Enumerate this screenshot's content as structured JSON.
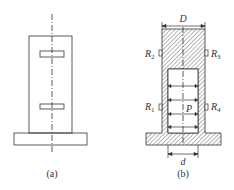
{
  "figures": [
    {
      "id": "a",
      "caption": "(a)",
      "description": "column with two strain gauges, external view"
    },
    {
      "id": "b",
      "caption": "(b)",
      "description": "sectional view of hollow column under internal pressure",
      "dimensions": {
        "outer_diameter": "D",
        "inner_diameter": "d"
      },
      "pressure_label": "P",
      "gauges": [
        {
          "name": "R",
          "sub": "2",
          "side": "left",
          "position": "upper"
        },
        {
          "name": "R",
          "sub": "3",
          "side": "right",
          "position": "upper"
        },
        {
          "name": "R",
          "sub": "1",
          "side": "left",
          "position": "lower"
        },
        {
          "name": "R",
          "sub": "4",
          "side": "right",
          "position": "lower"
        }
      ]
    }
  ],
  "colors": {
    "line": "#333333",
    "background": "#ffffff"
  }
}
